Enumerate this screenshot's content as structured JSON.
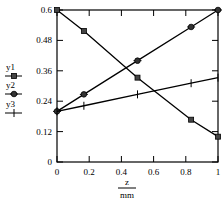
{
  "chart_data": {
    "type": "line",
    "title": "",
    "xlabel": "z",
    "xlabel_unit": "mm",
    "ylabel": "",
    "xlim": [
      0,
      1
    ],
    "ylim": [
      0,
      0.6
    ],
    "grid": false,
    "legend_position": "left",
    "x_ticks": [
      "0",
      "0.2",
      "0.4",
      "0.6",
      "0.8",
      "1"
    ],
    "y_ticks": [
      "0",
      "0.12",
      "0.24",
      "0.36",
      "0.48",
      "0.6"
    ],
    "x": [
      0,
      0.167,
      0.5,
      0.833,
      1
    ],
    "series": [
      {
        "name": "y1",
        "marker": "square",
        "values": [
          0.6,
          0.517,
          0.333,
          0.167,
          0.1
        ]
      },
      {
        "name": "y2",
        "marker": "diamond-dot",
        "values": [
          0.2,
          0.267,
          0.4,
          0.533,
          0.6
        ]
      },
      {
        "name": "y3",
        "marker": "plus",
        "values": [
          0.2,
          0.222,
          0.267,
          0.311,
          0.333
        ]
      }
    ]
  },
  "legend": [
    {
      "label": "y1"
    },
    {
      "label": "y2"
    },
    {
      "label": "y3"
    }
  ],
  "axis": {
    "x_label": "z",
    "x_unit": "mm"
  }
}
